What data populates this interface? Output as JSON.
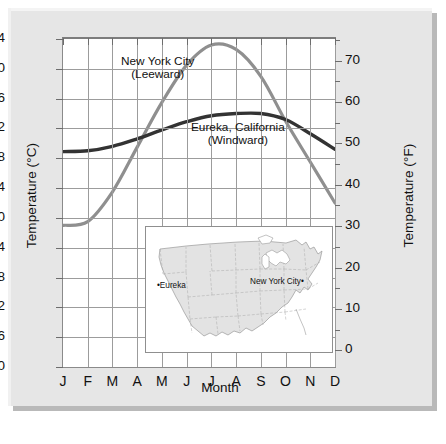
{
  "figure": {
    "xlabel": "Month",
    "ylabel_left": "Temperature (°C)",
    "ylabel_right": "Temperature (°F)"
  },
  "series_labels": {
    "nyc_line1": "New York City",
    "nyc_line2": "(Leeward)",
    "eureka_line1": "Eureka, California",
    "eureka_line2": "(Windward)"
  },
  "inset_map": {
    "eureka_marker": "•Eureka",
    "nyc_marker": "New York City•"
  },
  "colors": {
    "nyc_curve": "#8f8f8f",
    "eureka_curve": "#333333",
    "grid": "#9c9c9c",
    "frame": "#8a8a8a",
    "figure_bg": "#e6e6e6",
    "plot_bg": "#ffffff",
    "map_land": "#e3e3e3"
  },
  "chart_data": {
    "type": "line",
    "title": "",
    "xlabel": "Month",
    "ylabel": "Temperature (°C)",
    "ylabel_secondary": "Temperature (°F)",
    "grid": true,
    "legend": "inline-annotations",
    "categories": [
      "J",
      "F",
      "M",
      "A",
      "M",
      "J",
      "J",
      "A",
      "S",
      "O",
      "N",
      "D"
    ],
    "x_tick_labels": [
      "J",
      "F",
      "M",
      "A",
      "M",
      "J",
      "J",
      "A",
      "S",
      "O",
      "N",
      "D"
    ],
    "ylim": [
      -20,
      24
    ],
    "y_tick_labels": [
      "24",
      "20",
      "16",
      "12",
      "8",
      "4",
      "0",
      "−4",
      "−8",
      "−12",
      "−16",
      "−20"
    ],
    "y_ticks": [
      24,
      20,
      16,
      12,
      8,
      4,
      0,
      -4,
      -8,
      -12,
      -16,
      -20
    ],
    "ylim_secondary": [
      -4,
      75.2
    ],
    "y_ticks_secondary": [
      70,
      60,
      50,
      40,
      30,
      20,
      10,
      0
    ],
    "y_tick_labels_secondary": [
      "70",
      "60",
      "50",
      "40",
      "30",
      "20",
      "10",
      "0"
    ],
    "series": [
      {
        "name": "New York City (Leeward)",
        "color": "#8f8f8f",
        "values": [
          -1.0,
          -0.5,
          3.5,
          9.5,
          15.5,
          20.5,
          23.2,
          22.6,
          19.0,
          13.0,
          7.5,
          2.0
        ]
      },
      {
        "name": "Eureka, California (Windward)",
        "color": "#333333",
        "values": [
          8.9,
          9.0,
          9.6,
          10.6,
          11.8,
          12.9,
          13.7,
          14.0,
          14.0,
          13.2,
          11.3,
          9.2
        ]
      }
    ]
  }
}
